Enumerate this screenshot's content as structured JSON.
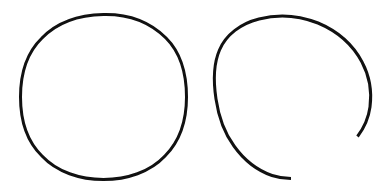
{
  "canvas": {
    "width": 391,
    "height": 196,
    "background_color": "#ffffff",
    "stroke_color": "#111111",
    "stroke_width": 3
  },
  "figure": {
    "shape_count": 2
  },
  "shapes": [
    {
      "id": "closed-circle",
      "kind": "circle",
      "closed": true,
      "label": "closed circle",
      "center_x": 103.5,
      "center_y": 97,
      "radius_x": 83,
      "radius_y": 83,
      "bbox": {
        "x": 20,
        "y": 14,
        "width": 167,
        "height": 166
      },
      "stroke_color": "#111111",
      "stroke_width": 3,
      "fill": "none",
      "gap_degrees": 0,
      "path": "M 103.5 14.5 C 128 14 150 22 166 38 C 181 53 186.5 74 186.5 97 C 186.5 120 180 141 165 156 C 150 172 127 179.5 103.5 179.5 C 80 179.5 57 172 42 156 C 26.5 141 20.5 120 20.5 97 C 20.5 74 26.5 53 42 38 C 57.5 22 79 15 103.5 14.5 Z"
    },
    {
      "id": "open-arc-circle",
      "kind": "arc",
      "closed": false,
      "label": "open circle with gap",
      "center_x": 292,
      "center_y": 98,
      "radius_x": 79,
      "radius_y": 83,
      "bbox": {
        "x": 214,
        "y": 15,
        "width": 157,
        "height": 166
      },
      "stroke_color": "#111111",
      "stroke_width": 3,
      "fill": "none",
      "gap_degrees": 61,
      "gap_start_angle_degrees": 29,
      "gap_end_angle_degrees": 90,
      "start_point": {
        "x": 357,
        "y": 136
      },
      "end_point": {
        "x": 291,
        "y": 178
      },
      "path": "M 357.5 136.5 C 364 128 368.5 118 370 107 C 372 92 369.5 76 362 62 C 353 45 337 31 318 23 C 299 15.5 278 14 259 19 C 241 23.5 226 34.5 219.5 50 C 213 65 213.5 82.5 216 99 C 218.5 116 224 132.5 234 146 C 244 160 257.5 170.5 272 175.5 C 278 177.5 284.5 178.5 291 178.5"
    }
  ]
}
